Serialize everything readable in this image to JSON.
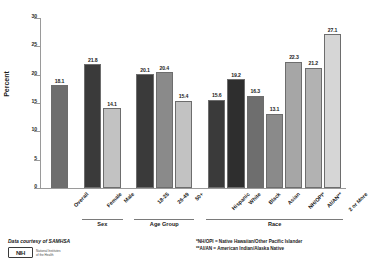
{
  "figure": {
    "credit": "Data courtesy of SAMHSA",
    "logo": {
      "mark_text": "NIH",
      "wordmark_line1": "National Institutes",
      "wordmark_line2": "of the Health"
    },
    "footnotes": [
      "*NH/OPI = Native Hawaiian/Other Pacific Islander",
      "**AI/AN = American Indian/Alaska Native"
    ]
  },
  "chart_data": {
    "type": "bar",
    "title": "",
    "xlabel": "",
    "ylabel": "Percent",
    "ylim": [
      0,
      30
    ],
    "yticks": [
      0,
      5,
      10,
      15,
      20,
      25,
      30
    ],
    "ytick_labels": [
      "0",
      "5",
      "10",
      "15",
      "20",
      "25",
      "30"
    ],
    "grid": false,
    "legend": "none",
    "categories": [
      "Overall",
      "Female",
      "Male",
      "18-25",
      "26-49",
      "50+",
      "Hispanic",
      "White",
      "Black",
      "Asian",
      "NH/OPI*",
      "AI/AN**",
      "2 or More"
    ],
    "values": [
      18.1,
      21.8,
      14.1,
      20.1,
      20.4,
      15.4,
      15.6,
      19.2,
      16.3,
      13.1,
      22.3,
      21.2,
      27.1
    ],
    "value_labels": [
      "18.1",
      "21.8",
      "14.1",
      "20.1",
      "20.4",
      "15.4",
      "15.6",
      "19.2",
      "16.3",
      "13.1",
      "22.3",
      "21.2",
      "27.1"
    ],
    "bar_colors": [
      "#6e6e6e",
      "#3a3a3a",
      "#c2c2c2",
      "#3a3a3a",
      "#8a8a8a",
      "#c2c2c2",
      "#3a3a3a",
      "#2e2e2e",
      "#6e6e6e",
      "#8a8a8a",
      "#a6a6a6",
      "#b2b2b2",
      "#d6d6d6"
    ],
    "groups": [
      {
        "label": "Sex",
        "start_index": 1,
        "end_index": 2
      },
      {
        "label": "Age Group",
        "start_index": 3,
        "end_index": 5
      },
      {
        "label": "Race",
        "start_index": 6,
        "end_index": 12
      }
    ]
  }
}
